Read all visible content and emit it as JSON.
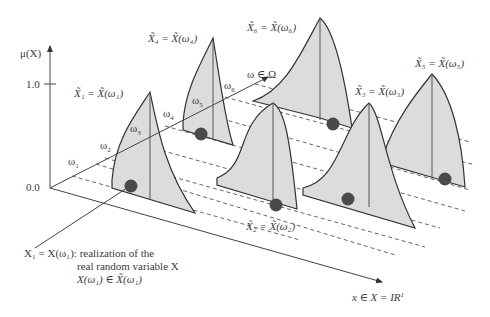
{
  "diagram": {
    "y_axis": {
      "label": "μ(X)",
      "tick_top": "1.0",
      "tick_origin": "0.0"
    },
    "omega_axis": {
      "label": "ω ∈ Ω"
    },
    "x_axis": {
      "label": "x ∈ X = IR",
      "label_sup": "1"
    },
    "omegas": [
      "ω1",
      "ω2",
      "ω3",
      "ω4",
      "ω5",
      "ω6"
    ],
    "fuzzy_sets": [
      {
        "id": "X1",
        "label": "X̃₁ = X̃(ω₁)"
      },
      {
        "id": "X2",
        "label": "X̃₂ = X̃(ω₂)"
      },
      {
        "id": "X3",
        "label": "X̃₃ = X̃(ω₃)"
      },
      {
        "id": "X4",
        "label": "X̃₄ = X̃(ω₄)"
      },
      {
        "id": "X5",
        "label": "X̃₅ = X̃(ω₅)"
      },
      {
        "id": "X6",
        "label": "X̃₆ = X̃(ω₆)"
      }
    ],
    "annotation": {
      "line1": "X₁ = X(ω₁): realization of the",
      "line2": "real random variable X",
      "line3": "X(ω₁) ∈ X̃(ω₁)"
    },
    "colors": {
      "fill": "#dcdcdc",
      "stroke": "#333333",
      "dot": "#4a4a4a"
    }
  }
}
